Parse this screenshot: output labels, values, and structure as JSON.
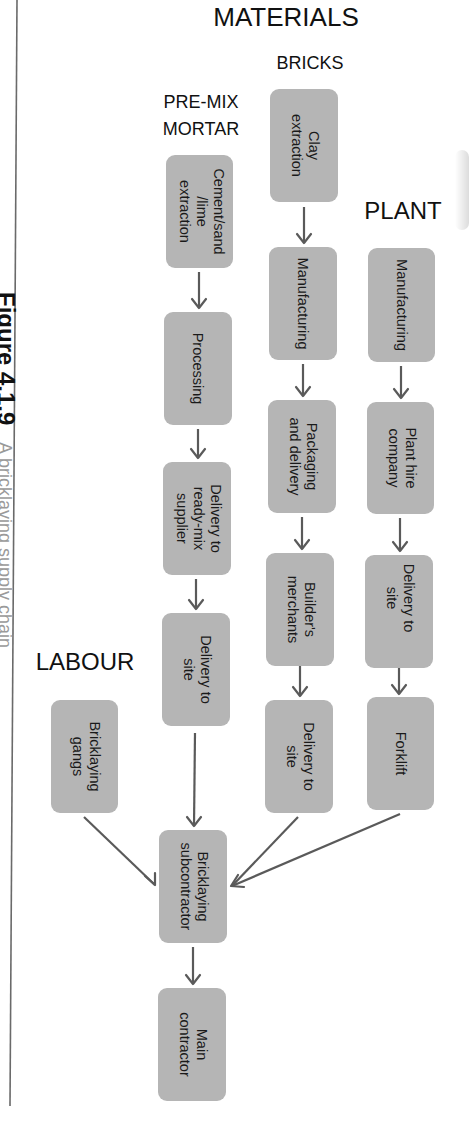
{
  "headings": {
    "materials": "MATERIALS",
    "bricks": "BRICKS",
    "premix_line1": "PRE-MIX",
    "premix_line2": "MORTAR",
    "plant": "PLANT",
    "labour": "LABOUR"
  },
  "caption": {
    "figure_number": "Figure 4.1.9",
    "text": "A bricklaying supply chain"
  },
  "colors": {
    "box_fill": "#b5b5b5",
    "arrow": "#5a5a5a",
    "text": "#1a1a1a",
    "background": "#ffffff"
  },
  "nodes": {
    "cement": {
      "lines": [
        "Cement/sand",
        "/lime",
        "extraction"
      ]
    },
    "processing": {
      "lines": [
        "Processing"
      ]
    },
    "delivery_readymix": {
      "lines": [
        "Delivery to",
        "ready-mix",
        "supplier"
      ]
    },
    "mortar_delivery_site": {
      "lines": [
        "Delivery to",
        "site"
      ]
    },
    "clay": {
      "lines": [
        "Clay",
        "extraction"
      ]
    },
    "bricks_manufacturing": {
      "lines": [
        "Manufacturing"
      ]
    },
    "packaging": {
      "lines": [
        "Packaging",
        "and delivery"
      ]
    },
    "builders_merchants": {
      "lines": [
        "Builder's",
        "merchants"
      ]
    },
    "bricks_delivery_site": {
      "lines": [
        "Delivery to",
        "site"
      ]
    },
    "plant_manufacturing": {
      "lines": [
        "Manufacturing"
      ]
    },
    "plant_hire": {
      "lines": [
        "Plant hire",
        "company"
      ]
    },
    "plant_delivery_site": {
      "lines": [
        "Delivery to",
        "site"
      ]
    },
    "forklift": {
      "lines": [
        "Forklift"
      ]
    },
    "bricklaying_gangs": {
      "lines": [
        "Bricklaying",
        "gangs"
      ]
    },
    "bricklaying_subcontractor": {
      "lines": [
        "Bricklaying",
        "subcontractor"
      ]
    },
    "main_contractor": {
      "lines": [
        "Main",
        "contractor"
      ]
    }
  },
  "edges": [
    [
      "cement",
      "processing"
    ],
    [
      "processing",
      "delivery_readymix"
    ],
    [
      "delivery_readymix",
      "mortar_delivery_site"
    ],
    [
      "mortar_delivery_site",
      "bricklaying_subcontractor"
    ],
    [
      "clay",
      "bricks_manufacturing"
    ],
    [
      "bricks_manufacturing",
      "packaging"
    ],
    [
      "packaging",
      "builders_merchants"
    ],
    [
      "builders_merchants",
      "bricks_delivery_site"
    ],
    [
      "bricks_delivery_site",
      "bricklaying_subcontractor"
    ],
    [
      "plant_manufacturing",
      "plant_hire"
    ],
    [
      "plant_hire",
      "plant_delivery_site"
    ],
    [
      "plant_delivery_site",
      "forklift"
    ],
    [
      "forklift",
      "bricklaying_subcontractor"
    ],
    [
      "bricklaying_gangs",
      "bricklaying_subcontractor"
    ],
    [
      "bricklaying_subcontractor",
      "main_contractor"
    ]
  ]
}
